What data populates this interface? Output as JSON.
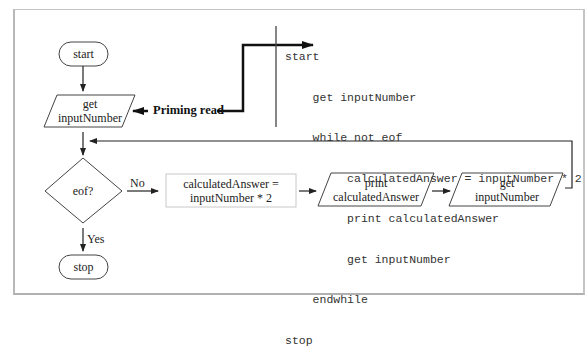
{
  "flowchart": {
    "start_terminal": "start",
    "priming_input": {
      "line1": "get",
      "line2": "inputNumber"
    },
    "priming_label": "Priming read",
    "decision": "eof?",
    "no_label": "No",
    "yes_label": "Yes",
    "process": {
      "line1": "calculatedAnswer =",
      "line2": "inputNumber * 2"
    },
    "print_output": {
      "line1": "print",
      "line2": "calculatedAnswer"
    },
    "loop_input": {
      "line1": "get",
      "line2": "inputNumber"
    },
    "stop_terminal": "stop"
  },
  "pseudocode": {
    "lines": [
      "start",
      "    get inputNumber",
      "    while not eof",
      "         calculatedAnswer = inputNumber * 2",
      "         print calculatedAnswer",
      "         get inputNumber",
      "    endwhile",
      "stop"
    ]
  },
  "colors": {
    "line": "#222222",
    "frame": "#bbbbbb",
    "process_border": "#c8c8c8"
  }
}
